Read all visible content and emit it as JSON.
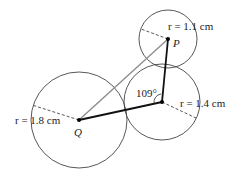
{
  "diagram": {
    "colors": {
      "circle_stroke": "#444444",
      "segment_stroke": "#111111",
      "diagonal_stroke": "#8a8a8a",
      "dashed_stroke": "#444444",
      "point_fill": "#000000",
      "text": "#222222"
    },
    "circles": [
      {
        "id": "circle-Q",
        "cx": 79,
        "cy": 120,
        "r": 48,
        "radius_label": "r = 1.8 cm",
        "radius_end": [
          32,
          105
        ]
      },
      {
        "id": "circle-middle",
        "cx": 162,
        "cy": 102,
        "r": 38,
        "radius_label": "r = 1.4 cm",
        "radius_end": [
          196,
          118
        ]
      },
      {
        "id": "circle-P",
        "cx": 168,
        "cy": 39,
        "r": 29,
        "radius_label": "r = 1.1 cm",
        "radius_end": [
          141,
          29
        ]
      }
    ],
    "points": {
      "Q": {
        "label": "Q",
        "x": 79,
        "y": 120
      },
      "M": {
        "label": "",
        "x": 162,
        "y": 102
      },
      "P": {
        "label": "P",
        "x": 168,
        "y": 39
      }
    },
    "angle": {
      "label": "109°",
      "at": "M"
    },
    "labels": {
      "r_Q": "r = 1.8 cm",
      "r_M": "r = 1.4 cm",
      "r_P": "r = 1.1 cm",
      "point_Q": "Q",
      "point_P": "P",
      "angle": "109°"
    }
  }
}
